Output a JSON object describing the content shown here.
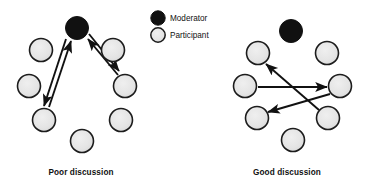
{
  "figure": {
    "type": "diagram",
    "background": "#ffffff",
    "width": 374,
    "height": 191
  },
  "legend": {
    "name": "legend",
    "items": [
      {
        "label": "Moderator",
        "role": "moderator",
        "marker": "filled-circle",
        "fill": "#111111",
        "stroke": "#111111",
        "cx": 158,
        "cy": 18,
        "r": 7.2,
        "label_x": 170,
        "label_y": 21
      },
      {
        "label": "Participant",
        "role": "participant",
        "marker": "light-circle",
        "fill": "#e3e3e3",
        "stroke": "#1a1a1a",
        "cx": 158,
        "cy": 35,
        "r": 7.2,
        "label_x": 170,
        "label_y": 38
      }
    ]
  },
  "panels": [
    {
      "id": "poor-discussion",
      "caption": "Poor discussion",
      "caption_x": 81,
      "caption_y": 175,
      "nodes": [
        {
          "id": "L-moderator",
          "role": "moderator",
          "cx": 77,
          "cy": 28,
          "r": 11.5
        },
        {
          "id": "L-p-upleft",
          "role": "participant",
          "cx": 41,
          "cy": 50,
          "r": 11.5
        },
        {
          "id": "L-p-upright",
          "role": "participant",
          "cx": 113,
          "cy": 50,
          "r": 11.5
        },
        {
          "id": "L-p-left",
          "role": "participant",
          "cx": 29,
          "cy": 86,
          "r": 11.5
        },
        {
          "id": "L-p-right",
          "role": "participant",
          "cx": 125,
          "cy": 86,
          "r": 11.5
        },
        {
          "id": "L-p-lowleft",
          "role": "participant",
          "cx": 44,
          "cy": 120,
          "r": 11.5
        },
        {
          "id": "L-p-lowright",
          "role": "participant",
          "cx": 121,
          "cy": 120,
          "r": 11.5
        },
        {
          "id": "L-p-bottom",
          "role": "participant",
          "cx": 82,
          "cy": 141,
          "r": 11.5
        }
      ],
      "arrows": [
        {
          "id": "L-a1",
          "from": "L-p-lowleft",
          "to": "L-moderator",
          "x1": 49,
          "y1": 107,
          "x2": 71,
          "y2": 41
        },
        {
          "id": "L-a2",
          "from": "L-moderator",
          "to": "L-p-lowleft",
          "x1": 66,
          "y1": 39,
          "x2": 44,
          "y2": 106
        },
        {
          "id": "L-a3",
          "from": "L-p-right",
          "to": "L-moderator",
          "x1": 118,
          "y1": 75,
          "x2": 88,
          "y2": 39
        },
        {
          "id": "L-a4",
          "from": "L-moderator",
          "to": "L-p-right",
          "x1": 89,
          "y1": 34,
          "x2": 119,
          "y2": 71
        }
      ]
    },
    {
      "id": "good-discussion",
      "caption": "Good discussion",
      "caption_x": 287,
      "caption_y": 175,
      "nodes": [
        {
          "id": "R-moderator",
          "role": "moderator",
          "cx": 291,
          "cy": 31,
          "r": 11.5
        },
        {
          "id": "R-p-upleft",
          "role": "participant",
          "cx": 258,
          "cy": 53,
          "r": 11.5
        },
        {
          "id": "R-p-upright",
          "role": "participant",
          "cx": 327,
          "cy": 53,
          "r": 11.5
        },
        {
          "id": "R-p-left",
          "role": "participant",
          "cx": 245,
          "cy": 86,
          "r": 11.5
        },
        {
          "id": "R-p-right",
          "role": "participant",
          "cx": 340,
          "cy": 86,
          "r": 11.5
        },
        {
          "id": "R-p-lowleft",
          "role": "participant",
          "cx": 257,
          "cy": 118,
          "r": 11.5
        },
        {
          "id": "R-p-lowright",
          "role": "participant",
          "cx": 328,
          "cy": 118,
          "r": 11.5
        },
        {
          "id": "R-p-bottom",
          "role": "participant",
          "cx": 293,
          "cy": 140,
          "r": 11.5
        }
      ],
      "arrows": [
        {
          "id": "R-a1",
          "from": "R-p-left",
          "to": "R-p-right",
          "x1": 258,
          "y1": 87,
          "x2": 327,
          "y2": 87
        },
        {
          "id": "R-a2",
          "from": "R-p-lowright",
          "to": "R-p-upleft",
          "x1": 319,
          "y1": 110,
          "x2": 266,
          "y2": 64
        },
        {
          "id": "R-a3",
          "from": "R-p-right",
          "to": "R-p-lowleft",
          "x1": 330,
          "y1": 94,
          "x2": 268,
          "y2": 112
        }
      ]
    }
  ]
}
